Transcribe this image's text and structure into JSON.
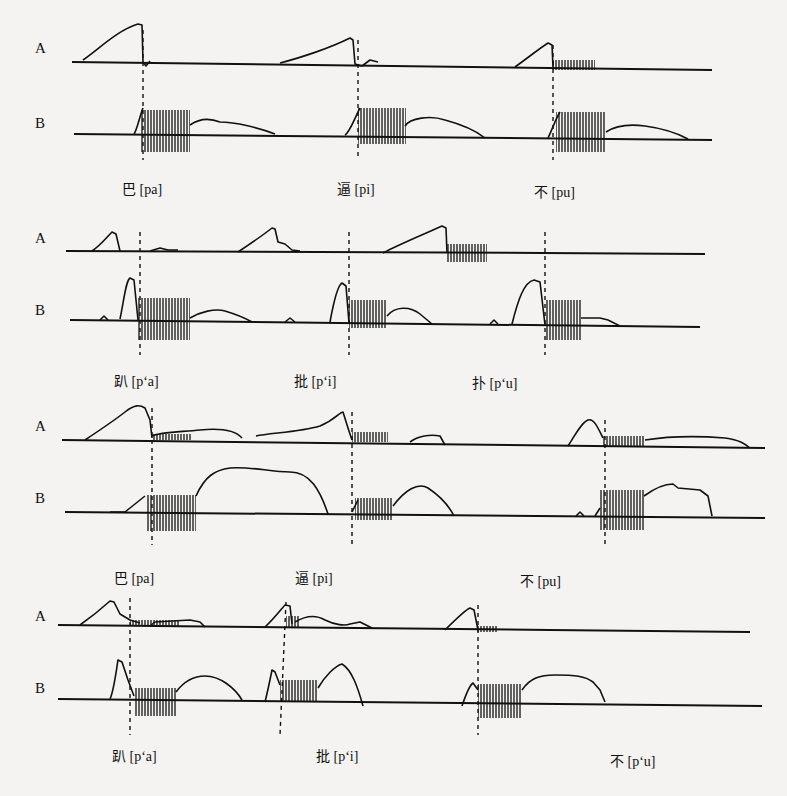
{
  "figure": {
    "panels": [
      {
        "id": 1,
        "row_labels": [
          "A",
          "B"
        ],
        "syllables": [
          "巴 [pa]",
          "逼 [pi]",
          "不 [pu]"
        ]
      },
      {
        "id": 2,
        "row_labels": [
          "A",
          "B"
        ],
        "syllables": [
          "趴 [p‘a]",
          "批 [p‘i]",
          "扑 [p‘u]"
        ]
      },
      {
        "id": 3,
        "row_labels": [
          "A",
          "B"
        ],
        "syllables": [
          "巴 [pa]",
          "逼 [pi]",
          "不 [pu]"
        ]
      },
      {
        "id": 4,
        "row_labels": [
          "A",
          "B"
        ],
        "syllables": [
          "趴 [p‘a]",
          "批 [p‘i]",
          "不 [p‘u]"
        ]
      }
    ]
  }
}
